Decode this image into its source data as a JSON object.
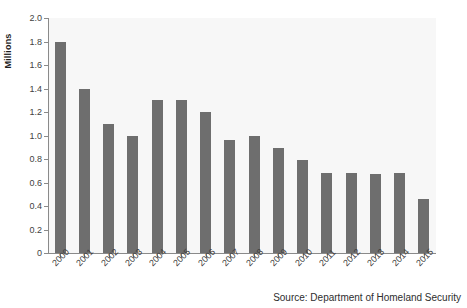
{
  "chart_data": {
    "type": "bar",
    "title": "",
    "xlabel": "",
    "ylabel": "Millions",
    "categories": [
      "2000",
      "2001",
      "2002",
      "2003",
      "2004",
      "2005",
      "2006",
      "2007",
      "2008",
      "2009",
      "2010",
      "2011",
      "2012",
      "2013",
      "2014",
      "2015"
    ],
    "values": [
      1.8,
      1.4,
      1.1,
      1.0,
      1.3,
      1.3,
      1.2,
      0.96,
      1.0,
      0.89,
      0.79,
      0.68,
      0.68,
      0.67,
      0.68,
      0.46
    ],
    "ylim": [
      0,
      2.0
    ],
    "ytick_labels": [
      "0",
      "0.2",
      "0.4",
      "0.6",
      "0.8",
      "1.0",
      "1.2",
      "1.4",
      "1.6",
      "1.8",
      "2.0"
    ],
    "ytick_values": [
      0,
      0.2,
      0.4,
      0.6,
      0.8,
      1.0,
      1.2,
      1.4,
      1.6,
      1.8,
      2.0
    ],
    "grid": false,
    "legend": null,
    "bar_color": "#6e6e6e",
    "plot_background": "#f7f7f7",
    "axis_color": "#8a8a8a"
  },
  "source_note": "Source: Department of Homeland Security"
}
